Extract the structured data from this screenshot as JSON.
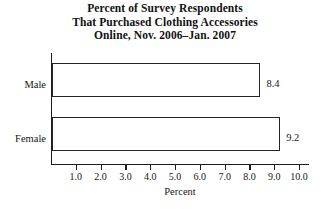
{
  "chart_data": {
    "type": "bar",
    "orientation": "horizontal",
    "title": "Percent of Survey Respondents That Purchased Clothing Accessories Online, Nov. 2006–Jan. 2007",
    "title_lines": [
      "Percent of Survey Respondents",
      "That Purchased Clothing Accessories",
      "Online, Nov. 2006–Jan. 2007"
    ],
    "categories": [
      "Male",
      "Female"
    ],
    "values": [
      8.4,
      9.2
    ],
    "value_labels": [
      "8.4",
      "9.2"
    ],
    "xlabel": "Percent",
    "ylabel": "",
    "xlim": [
      0,
      10.4
    ],
    "xticks": [
      1.0,
      2.0,
      3.0,
      4.0,
      5.0,
      6.0,
      7.0,
      8.0,
      9.0,
      10.0
    ],
    "xtick_labels": [
      "1.0",
      "2.0",
      "3.0",
      "4.0",
      "5.0",
      "6.0",
      "7.0",
      "8.0",
      "9.0",
      "10.0"
    ],
    "grid": false,
    "legend": false,
    "bar_fill_color": "#ffffff",
    "bar_border_color": "#252525",
    "axis_color": "#1d1d1d",
    "text_color": "#151515",
    "background_color": "#ffffff"
  }
}
